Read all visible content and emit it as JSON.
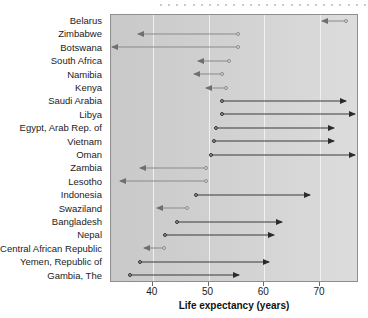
{
  "chart_data": {
    "type": "bar",
    "title": "",
    "xlabel": "Life expectancy (years)",
    "ylabel": "",
    "xlim": [
      32.5,
      77
    ],
    "xticks": [
      40,
      50,
      60,
      70
    ],
    "xticklabels": [
      "40",
      "50",
      "60",
      "70"
    ],
    "grid": true,
    "legend": "none",
    "series_note": "Arrow runs from start value (circle) to end value (arrowhead); leftward light-grey arrows are declines, rightward dark arrows are gains.",
    "categories": [
      "Belarus",
      "Zimbabwe",
      "Botswana",
      "South Africa",
      "Namibia",
      "Kenya",
      "Saudi Arabia",
      "Libya",
      "Egypt, Arab Rep. of",
      "Vietnam",
      "Oman",
      "Zambia",
      "Lesotho",
      "Indonesia",
      "Swaziland",
      "Bangladesh",
      "Nepal",
      "Central African Republic",
      "Yemen, Republic of",
      "Gambia, The"
    ],
    "series": [
      {
        "name": "start",
        "values": [
          74.8,
          55.5,
          55.5,
          53.8,
          52.6,
          53.3,
          52.6,
          52.6,
          51.5,
          51.2,
          50.6,
          49.7,
          49.7,
          47.9,
          46.3,
          44.5,
          42.4,
          42.2,
          37.8,
          36.1
        ]
      },
      {
        "name": "end",
        "values": [
          70.5,
          37.5,
          32.8,
          48.3,
          47.5,
          49.7,
          74.8,
          76.4,
          72.7,
          72.7,
          76.4,
          37.8,
          34.3,
          68.3,
          40.9,
          63.3,
          62.0,
          38.6,
          61.0,
          55.7
        ]
      },
      {
        "name": "direction",
        "values": [
          "decline",
          "decline",
          "decline",
          "decline",
          "decline",
          "decline",
          "increase",
          "increase",
          "increase",
          "increase",
          "increase",
          "decline",
          "decline",
          "increase",
          "decline",
          "increase",
          "increase",
          "decline",
          "increase",
          "increase"
        ]
      }
    ]
  },
  "axis": {
    "title": "Life expectancy (years)"
  },
  "decor": {
    "dot_count": 26,
    "dot_color": "#b9b9b9"
  },
  "colors": {
    "decline": "#8a8a8a",
    "increase": "#2b2b2b",
    "plot_background_left": "#c9c9c9",
    "plot_background_right": "#dcdcdc",
    "gridline": "#f1f1f1"
  }
}
